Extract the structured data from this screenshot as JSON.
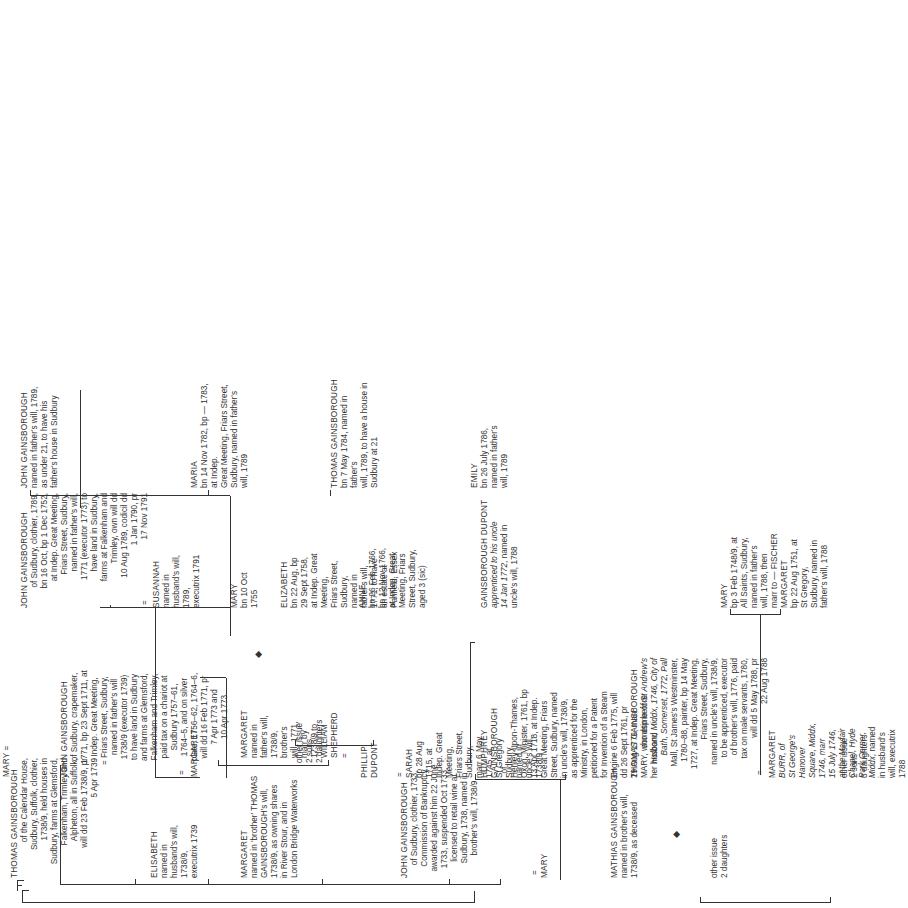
{
  "generations": {
    "gen1": {
      "thomas": {
        "name": "THOMAS GAINSBOROUGH",
        "desc": "of the Calendar House,\nSudbury, Suffolk, clothier,\n1738/9, held houses in\nSudbury, farms at Glemsford,\nFalkenham, Trimley and\nAlpheton, all in Suffolk,\nwill dd 23 Feb 1738/9, pr\n5 Apr 1739"
      },
      "elisabeth": {
        "name": "ELISABETH",
        "desc": "named in\nhusband's will,\n1738/9,\nexecutrix 1739"
      },
      "margaret_sister": {
        "name": "MARGARET",
        "desc": "named in 'brother' THOMAS\nGAINSBOROUGH's will,\n1738/9, as owning shares\nin River Stour, and in\nLondon Bridge Waterworks"
      }
    },
    "gen2": {
      "mary_w1": {
        "name": "MARY"
      },
      "john_crapemaker": {
        "name": "JOHN GAINSBOROUGH",
        "desc": "of Sudbury, crapemaker,\n1771, bp 23 Sept 1711, at\nIndep. Great Meeting,\nFriars Street, Sudbury,\nnamed in father's will\n1738/9 (executor 1739)\nto have land in Sudbury\nand farms at Glemsford,\nFalkenham and Trimley,\npaid tax on a chariot at\nSudbury 1757–61,\n1764–5, and on silver\nplate, 1756–62, 1764–6,\nwill dd 16 Feb 1771, pr\n7 Apr 1773 and\n10 Apr 1773"
      },
      "margaret_w2": {
        "name": "MARGARET"
      },
      "margaret_shepherd": {
        "name": "MARGARET",
        "desc": "named in\nfather's will,\n1738/9,\nbrother's\nwill, 1771,\nmarr by\n1738/9 to\nWILLIAM\nSHEPHERD\n="
      },
      "other_issue_a": {
        "label": "other issue",
        "detail": "2 sons\n2 daughters"
      },
      "phillip": {
        "name": "PHILLIP\nDUPONT"
      },
      "sarah": {
        "name": "SARAH",
        "desc": "bp 28 Aug\n1715, at\nIndep. Great\nMeeting,\nFriars Street,\nSudbury,\nmarr 6 May\n1745, at\nSt Gregory\nSudbury,\nnamed in\nuncle's will,\n1738/9"
      },
      "john_clothier": {
        "name": "JOHN GAINSBOROUGH",
        "desc": "of Sudbury, clothier, 1733,\nCommission of Bankruptcy\nawarded against him 22 June\n1733, suspended Oct 1733,\nlicensed to retail wine at\nSudbury, 1738, named in\nbrother's will, 1738/9"
      },
      "mary_w3": {
        "name": "MARY"
      },
      "humphrey": {
        "name": "HUMPHREY\nGAINSBOROUGH",
        "desc": ", of\nHenley-upon-Thames,\nOxon, Minister, 1761, bp\n13 Apr 1718, at Indep.\nGreat Meeting, Friars\nStreet, Sudbury, named\nin uncle's will, 1738/9,\nas apprenticed for the\nMinistry, in London,\npetitioned for a Patent\nfor Invention of a Steam\nEngine 6 Feb 1775, will\ndd 26 Sept 1761, pr\n29 Aug 1776, marr\nMARY, who dsp before\nher husband"
      },
      "mathias": {
        "name": "MATHIAS GAINSBOROUGH",
        "desc": "named in brother's will,\n1738/9, as deceased"
      },
      "thomas_painter": {
        "name": "THOMAS GAINSBOROUGH",
        "desc_parts": [
          "sometime ",
          "of St Andrew's",
          "\n",
          "Holborn, Middx, 1746, City of",
          "\n",
          "Bath, Somerset, 1772, Pall",
          "\n",
          "Mall, St James's Westminster,\n1780–88, painter, bp 14 May\n1727, at Indep. Great Meeting,\nFriars Street, Sudbury,\nnamed in uncle's will, 1738/9,\nto be apprenticed, executor\nof brother's will, 1776, paid\ntax on male servants, 1780,\nwill dd 5 May 1788, pr\n22 Aug 1788"
        ]
      },
      "margaret_burr": {
        "name": "MARGARET",
        "desc_parts": [
          "BURR, of\nSt George's\nHanover\nSquare, Middx,\n1746, marr\n15 July 1746,\nat the Mayfair\nChapel, Hyde\nPark Corner,\nMiddx",
          ", named\nin husband's\nwill, executrix\n1788"
        ]
      },
      "other_issue_b": {
        "label": "other issue",
        "detail": "2 daughters"
      },
      "other_issue_c": {
        "label": "other issue",
        "detail": "2 sons\n3 daughters"
      }
    },
    "gen3": {
      "john_clothier_1789": {
        "name": "JOHN GAINSBOROUGH",
        "desc": "of Sudbury, clothier, 1789,\nbn 16 Oct, bp 1 Dec 1752,\nat Indep. Great Meeting,\nFriars Street, Sudbury,\nnamed in father's will,\n1771 (executor 1773) to\nhave land in Sudbury,\nfarms at Falkenham and\nTrimley, own will dd\n10 Aug 1789, codicil dd\n1 Jan 1790, pr\n17 Nov 1791"
      },
      "susannah": {
        "name": "SUSANNAH",
        "desc": "named in\nhusband's will,\n1789,\nexecutrix 1791"
      },
      "mary_1755": {
        "name": "MARY",
        "desc": "bn 10 Oct\n1755"
      },
      "elizabeth": {
        "name": "ELIZABETH",
        "desc": "bn 22 Aug, bp\n29 Sept 1758,\nat Indep. Great\nMeeting,\nFriars Street,\nSudbury,\nnamed in\nfather's will,\n1771, to have\nan estate at\nPanfield, Essex"
      },
      "anne": {
        "name": "ANNE",
        "desc": "bn 26 Feb 1766,\nbp 12 Nov 1766,\nat Indep. Great\nMeeting, Friars\nStreet, Sudbury,\naged 3 (sic)"
      },
      "gainsborough_dupont": {
        "name": "GAINSBOROUGH DUPONT",
        "desc_parts": [
          "apprenticed to his uncle\n14 Jan 1772",
          ", named in\nuncle's will, 1788"
        ]
      },
      "mary_fischer": {
        "name": "MARY",
        "desc": "bp 3 Feb 1748/9, at\nAll Saints, Sudbury,\nnamed in father's\nwill, 1788, then\nmarr to — FISCHER"
      },
      "margaret_1751": {
        "name": "MARGARET",
        "desc": "bp 22 Aug 1751, at\nSt Gregory,\nSudbury, named in\nfather's will, 1788"
      }
    },
    "gen4": {
      "john_minor": {
        "name": "JOHN GAINSBOROUGH",
        "desc": "named in father's will, 1789,\nas under 21, to have his\nfather's house in Sudbury"
      },
      "maria": {
        "name": "MARIA",
        "desc": "bn 14 Nov 1782, bp — 1783, at Indep.\nGreat Meeting, Friars Street,\nSudbury, named in father's will, 1789"
      },
      "thomas_1784": {
        "name": "THOMAS GAINSBOROUGH",
        "desc": "bn 7 May 1784, named in father's\nwill, 1789, to have a house in\nSudbury at 21"
      },
      "emily": {
        "name": "EMILY",
        "desc": "bn 26 July 1786,\nnamed in father's\nwill, 1789"
      }
    }
  },
  "symbols": {
    "marriage": "=",
    "dsp": "◆"
  }
}
